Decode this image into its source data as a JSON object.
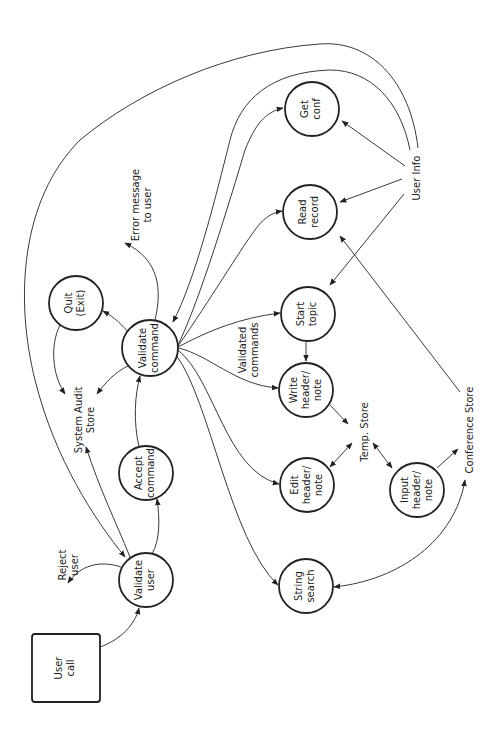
{
  "diagram": {
    "type": "data-flow-diagram",
    "orientation": "rotated-90-ccw",
    "colors": {
      "background": "#ffffff",
      "stroke": "#222222",
      "edge": "#3a3a3a"
    },
    "nodes": {
      "user_call": {
        "shape": "rect",
        "lines": [
          "User",
          "call"
        ]
      },
      "validate_user": {
        "shape": "circle",
        "lines": [
          "Validate",
          "user"
        ]
      },
      "accept_command": {
        "shape": "circle",
        "lines": [
          "Accept",
          "command"
        ]
      },
      "quit": {
        "shape": "circle",
        "lines": [
          "Quit",
          "(Exit)"
        ]
      },
      "validate_command": {
        "shape": "circle",
        "lines": [
          "Validate",
          "command"
        ]
      },
      "get_conf": {
        "shape": "circle",
        "lines": [
          "Get",
          "conf"
        ]
      },
      "read_record": {
        "shape": "circle",
        "lines": [
          "Read",
          "record"
        ]
      },
      "start_topic": {
        "shape": "circle",
        "lines": [
          "Start",
          "topic"
        ]
      },
      "write_header": {
        "shape": "circle",
        "lines": [
          "Write",
          "header/",
          "note"
        ]
      },
      "edit_header": {
        "shape": "circle",
        "lines": [
          "Edit",
          "header/",
          "note"
        ]
      },
      "input_header": {
        "shape": "circle",
        "lines": [
          "Input",
          "header/",
          "note"
        ]
      },
      "string_search": {
        "shape": "circle",
        "lines": [
          "String",
          "search"
        ]
      }
    },
    "labels": {
      "reject_user": [
        "Reject",
        "user"
      ],
      "system_audit_store": [
        "System Audit",
        "Store"
      ],
      "error_message": [
        "Error message",
        "to user"
      ],
      "validated_commands": [
        "Validated",
        "commands"
      ],
      "temp_store": [
        "Temp. Store"
      ],
      "conference_store": [
        "Conference Store"
      ],
      "user_info": [
        "User Info"
      ]
    },
    "edges": [
      {
        "from": "user_call",
        "to": "validate_user"
      },
      {
        "from": "validate_user",
        "to": "reject_user"
      },
      {
        "from": "validate_user",
        "to": "system_audit_store"
      },
      {
        "from": "validate_user",
        "to": "accept_command"
      },
      {
        "from": "user_info",
        "to": "validate_user"
      },
      {
        "from": "accept_command",
        "to": "validate_command"
      },
      {
        "from": "validate_command",
        "to": "quit"
      },
      {
        "from": "validate_command",
        "to": "system_audit_store"
      },
      {
        "from": "quit",
        "to": "system_audit_store"
      },
      {
        "from": "validate_command",
        "to": "error_message"
      },
      {
        "from": "user_info",
        "to": "validate_command"
      },
      {
        "from": "validate_command",
        "to": "get_conf"
      },
      {
        "from": "validate_command",
        "to": "read_record"
      },
      {
        "from": "validate_command",
        "to": "start_topic"
      },
      {
        "from": "validate_command",
        "to": "write_header"
      },
      {
        "from": "validate_command",
        "to": "edit_header"
      },
      {
        "from": "validate_command",
        "to": "string_search"
      },
      {
        "from": "user_info",
        "to": "get_conf"
      },
      {
        "from": "user_info",
        "to": "read_record"
      },
      {
        "from": "user_info",
        "to": "start_topic"
      },
      {
        "from": "start_topic",
        "to": "write_header"
      },
      {
        "from": "write_header",
        "to": "temp_store"
      },
      {
        "from": "edit_header",
        "to": "temp_store",
        "bidirectional": true
      },
      {
        "from": "input_header",
        "to": "temp_store",
        "bidirectional": true
      },
      {
        "from": "input_header",
        "to": "conference_store"
      },
      {
        "from": "conference_store",
        "to": "read_record"
      },
      {
        "from": "conference_store",
        "to": "string_search",
        "bidirectional": true
      }
    ]
  }
}
